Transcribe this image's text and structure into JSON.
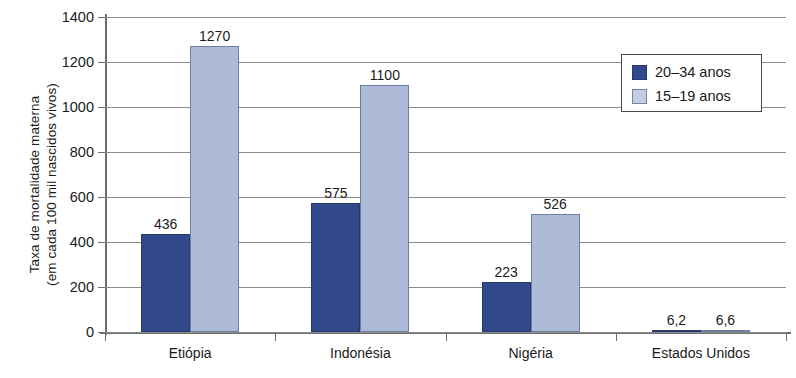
{
  "chart_data": {
    "type": "bar",
    "title": "",
    "xlabel": "",
    "ylabel": "Taxa de mortalidade materna (em cada 100 mil nascidos vivos)",
    "ylabel_lines": [
      "Taxa de mortalidade materna",
      "(em cada 100 mil nascidos vivos)"
    ],
    "categories": [
      "Etiópia",
      "Indonésia",
      "Nigéria",
      "Estados Unidos"
    ],
    "series": [
      {
        "name": "20–34 anos",
        "color": "#31498a",
        "values": [
          436,
          575,
          223,
          6.2
        ],
        "labels": [
          "436",
          "575",
          "223",
          "6,2"
        ]
      },
      {
        "name": "15–19 anos",
        "color": "#aebbd8",
        "values": [
          1270,
          1100,
          526,
          6.6
        ],
        "labels": [
          "1270",
          "1100",
          "526",
          "6,6"
        ]
      }
    ],
    "ylim": [
      0,
      1400
    ],
    "ytick_values": [
      0,
      200,
      400,
      600,
      800,
      1000,
      1200,
      1400
    ],
    "ytick_labels": [
      "0",
      "200",
      "400",
      "600",
      "800",
      "1000",
      "1200",
      "1400"
    ],
    "grid": true,
    "legend_position": "top-right"
  },
  "legend": {
    "entries": [
      {
        "label": "20–34 anos"
      },
      {
        "label": "15–19 anos"
      }
    ]
  },
  "colors": {
    "series_a": "#31498a",
    "series_b": "#aebbd8",
    "axis": "#6e6e6e",
    "grid": "#8d8d8d",
    "text": "#1a1a1a",
    "background": "#ffffff"
  }
}
